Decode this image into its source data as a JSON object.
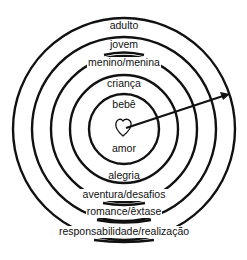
{
  "diagram": {
    "rings": [
      {
        "top_label": "bebê",
        "bottom_label": "amor"
      },
      {
        "top_label": "criança",
        "bottom_label": "alegria"
      },
      {
        "top_label": "menino/menina",
        "bottom_label": "aventura/desafios"
      },
      {
        "top_label": "jovem",
        "bottom_label": "romance/êxtase"
      },
      {
        "top_label": "adulto",
        "bottom_label": "responsabilidade/realização"
      }
    ],
    "center_icon": "heart-icon",
    "arrow": "arrow-icon",
    "colors": {
      "stroke": "#111111",
      "background": "#ffffff"
    }
  }
}
